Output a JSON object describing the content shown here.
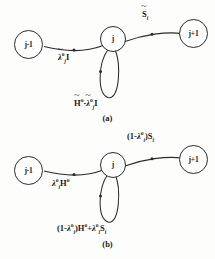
{
  "figure": {
    "type": "signal-flow-graph",
    "panels": [
      {
        "id": "a",
        "caption": "(a)",
        "nodes": [
          {
            "id": "left",
            "label": "j-1"
          },
          {
            "id": "center",
            "label": "j"
          },
          {
            "id": "right",
            "label": "j+1"
          }
        ],
        "edges": [
          {
            "id": "left-edge",
            "from": "left",
            "to": "center",
            "label_plain": "~λⱼᵒ I",
            "label_parts": {
              "tilde_symbol": "λ",
              "subscript": "j",
              "superscript": "o",
              "trailing": "I"
            }
          },
          {
            "id": "right-edge",
            "from": "center",
            "to": "right",
            "label_plain": "~Sᵢ",
            "label_parts": {
              "tilde_symbol": "S",
              "subscript": "i",
              "superscript": "",
              "trailing": ""
            }
          },
          {
            "id": "self-loop",
            "from": "center",
            "to": "center",
            "label_plain": "~Hᵒ - ~λⱼᵒ I",
            "label_parts": {
              "term1_symbol": "H",
              "term1_superscript": "o",
              "operator": "-",
              "term2_symbol": "λ",
              "term2_subscript": "j",
              "term2_superscript": "o",
              "trailing": "I"
            }
          }
        ]
      },
      {
        "id": "b",
        "caption": "(b)",
        "nodes": [
          {
            "id": "left",
            "label": "j-1"
          },
          {
            "id": "center",
            "label": "j"
          },
          {
            "id": "right",
            "label": "j+1"
          }
        ],
        "edges": [
          {
            "id": "left-edge",
            "from": "left",
            "to": "center",
            "label_plain": "λᵢᵒ Hᵒ",
            "label_parts": {
              "lambda": "λ",
              "lambda_subscript": "i",
              "lambda_superscript": "o",
              "trailing_symbol": "H",
              "trailing_superscript": "o"
            }
          },
          {
            "id": "right-edge",
            "from": "center",
            "to": "right",
            "label_plain": "(1- λᵢᵒ ) Sᵢ",
            "label_parts": {
              "open": "(1-",
              "lambda": "λ",
              "lambda_subscript": "i",
              "lambda_superscript": "o",
              "close": ")",
              "trailing_symbol": "S",
              "trailing_subscript": "i"
            }
          },
          {
            "id": "self-loop",
            "from": "center",
            "to": "center",
            "label_plain": "(1- λᵢᵒ ) Hᵒ + λᵢᵒ Sᵢ",
            "label_parts": {
              "open": "(1-",
              "lambda": "λ",
              "lambda_subscript": "i",
              "lambda_superscript": "o",
              "close": ")",
              "term1": "H",
              "term1_superscript": "o",
              "operator": "+",
              "lambda2": "λ",
              "lambda2_subscript": "i",
              "lambda2_superscript": "o",
              "term2": "S",
              "term2_subscript": "i"
            }
          }
        ]
      }
    ]
  },
  "labels": {
    "a": {
      "node_left": "j-1",
      "node_center": "j",
      "node_right": "j+1",
      "caption": "(a)"
    },
    "b": {
      "node_left": "j-1",
      "node_center": "j",
      "node_right": "j+1",
      "caption": "(b)"
    }
  },
  "symbols": {
    "lambda": "λ",
    "sub_i": "i",
    "sub_j": "j",
    "sup_o": "o",
    "cap_I": "I",
    "cap_H": "H",
    "cap_S": "S",
    "open_paren_one_minus": "(1-",
    "close_paren": ")",
    "plus": "+",
    "minus": "-"
  },
  "colors": {
    "ink": "#2b2b2b",
    "paper": "#fdfdfc"
  }
}
